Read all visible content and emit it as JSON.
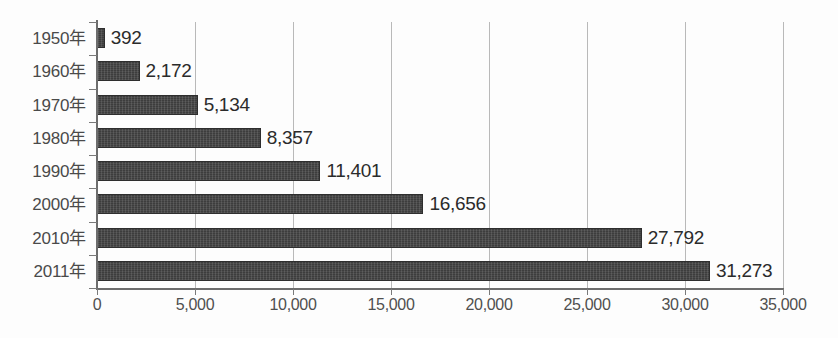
{
  "chart_data": {
    "type": "bar",
    "orientation": "horizontal",
    "title": "",
    "subtitle": "",
    "xlabel": "",
    "ylabel": "",
    "categories": [
      "1950年",
      "1960年",
      "1970年",
      "1980年",
      "1990年",
      "2000年",
      "2010年",
      "2011年"
    ],
    "values": [
      392,
      2172,
      5134,
      8357,
      11401,
      16656,
      27792,
      31273
    ],
    "value_labels": [
      "392",
      "2,172",
      "5,134",
      "8,357",
      "11,401",
      "16,656",
      "27,792",
      "31,273"
    ],
    "series": [
      {
        "name": "",
        "values": [
          392,
          2172,
          5134,
          8357,
          11401,
          16656,
          27792,
          31273
        ]
      }
    ],
    "xlim": [
      0,
      35000
    ],
    "xticks": [
      0,
      5000,
      10000,
      15000,
      20000,
      25000,
      30000,
      35000
    ],
    "xtick_labels": [
      "0",
      "5,000",
      "10,000",
      "15,000",
      "20,000",
      "25,000",
      "30,000",
      "35,000"
    ],
    "grid": "vertical",
    "legend": "none",
    "bar_color": "#3d3d3d",
    "gridline_color": "#b9b9b9",
    "axis_color": "#6d6d6d",
    "label_color": "#4a4a4a",
    "value_color": "#2b2b2b",
    "background_color": "#fdfdfd"
  }
}
